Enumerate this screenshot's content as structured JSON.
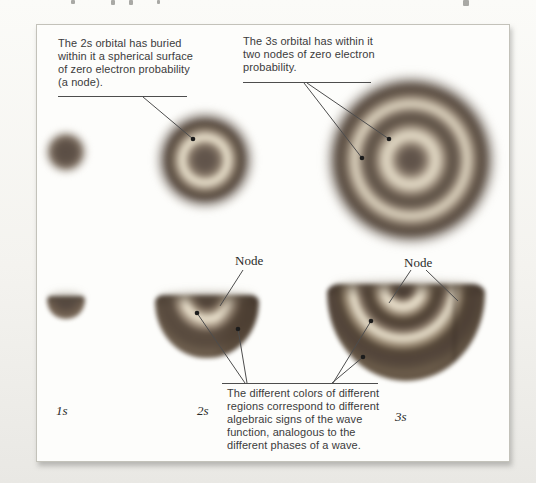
{
  "figure": {
    "callouts": {
      "orbital_2s": "The 2s orbital has buried\nwithin it a spherical surface\nof zero electron probability\n(a node).",
      "orbital_3s": "The 3s orbital has within it\ntwo nodes of zero electron\nprobability.",
      "node_label_2s": "Node",
      "node_label_3s": "Node",
      "color_note": "The different colors of different\nregions correspond to different\nalgebraic signs of the wave\nfunction, analogous to the\ndifferent phases of a wave."
    },
    "orbital_labels": [
      "1s",
      "2s",
      "3s"
    ],
    "colors": {
      "orbital_dark": "#55483f",
      "orbital_mid": "#8a7a68",
      "node_light": "#e0d6c2",
      "callout_line": "#4d4d4d",
      "text": "#3b3b3b",
      "panel_background": "#fdfdfb",
      "panel_border": "#c3c2ba"
    }
  }
}
